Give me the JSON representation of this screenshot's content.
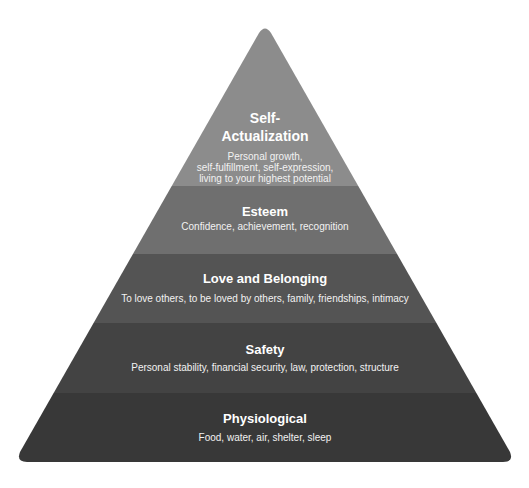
{
  "diagram": {
    "type": "pyramid",
    "tiers": [
      {
        "title_lines": [
          "Self-",
          "Actualization"
        ],
        "desc_lines": [
          "Personal growth,",
          "self-fulfillment, self-expression,",
          "living to your highest potential"
        ],
        "color": "#8c8c8c"
      },
      {
        "title_lines": [
          "Esteem"
        ],
        "desc_lines": [
          "Confidence, achievement, recognition"
        ],
        "color": "#6f6f6f"
      },
      {
        "title_lines": [
          "Love and Belonging"
        ],
        "desc_lines": [
          "To love others, to be loved by others, family, friendships, intimacy"
        ],
        "color": "#545454"
      },
      {
        "title_lines": [
          "Safety"
        ],
        "desc_lines": [
          "Personal stability, financial security, law, protection, structure"
        ],
        "color": "#434343"
      },
      {
        "title_lines": [
          "Physiological"
        ],
        "desc_lines": [
          "Food, water, air, shelter, sleep"
        ],
        "color": "#383838"
      }
    ]
  }
}
